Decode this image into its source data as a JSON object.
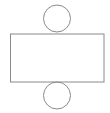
{
  "diagram": {
    "type": "cylinder-net",
    "stroke_color": "#8a8a8a",
    "background": "#ffffff",
    "shapes": {
      "top_circle": {
        "cx": 57,
        "cy": 18.5,
        "r": 13.5
      },
      "rectangle": {
        "x": 10.5,
        "y": 34,
        "width": 93.5,
        "height": 48
      },
      "bottom_circle": {
        "cx": 57,
        "cy": 95.5,
        "r": 13.5
      }
    }
  }
}
